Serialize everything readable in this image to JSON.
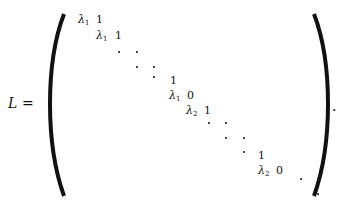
{
  "equation": {
    "lhs": "L",
    "equals": "=",
    "terminator": ".",
    "entries": [
      {
        "text": "λ",
        "sub": "1",
        "x": 78,
        "y": 14
      },
      {
        "text": "1",
        "sub": "",
        "x": 96,
        "y": 14
      },
      {
        "text": "λ",
        "sub": "1",
        "x": 96,
        "y": 30
      },
      {
        "text": "1",
        "sub": "",
        "x": 115,
        "y": 30
      },
      {
        "text": "1",
        "sub": "",
        "x": 170,
        "y": 75
      },
      {
        "text": "λ",
        "sub": "1",
        "x": 169,
        "y": 90
      },
      {
        "text": "0",
        "sub": "",
        "x": 187,
        "y": 90
      },
      {
        "text": "λ",
        "sub": "2",
        "x": 186,
        "y": 105
      },
      {
        "text": "1",
        "sub": "",
        "x": 204,
        "y": 105
      },
      {
        "text": "1",
        "sub": "",
        "x": 258,
        "y": 150
      },
      {
        "text": "λ",
        "sub": "2",
        "x": 258,
        "y": 165
      },
      {
        "text": "0",
        "sub": "",
        "x": 276,
        "y": 165
      }
    ]
  }
}
